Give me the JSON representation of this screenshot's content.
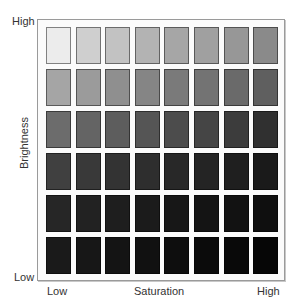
{
  "axes": {
    "y_title": "Brightness",
    "y_high": "High",
    "y_low": "Low",
    "x_title": "Saturation",
    "x_low": "Low",
    "x_high": "High"
  },
  "grid": {
    "rows": 6,
    "cols": 8,
    "colors": [
      [
        "#ececec",
        "#cfcfcf",
        "#c2c2c2",
        "#b3b3b3",
        "#a6a6a6",
        "#a0a0a0",
        "#979797",
        "#8a8a8a"
      ],
      [
        "#a5a5a5",
        "#9b9b9b",
        "#8f8f8f",
        "#858585",
        "#7a7a7a",
        "#737373",
        "#6a6a6a",
        "#5f5f5f"
      ],
      [
        "#6c6c6c",
        "#646464",
        "#5d5d5d",
        "#555555",
        "#4c4c4c",
        "#454545",
        "#3c3c3c",
        "#303030"
      ],
      [
        "#404040",
        "#393939",
        "#333333",
        "#2e2e2e",
        "#282828",
        "#242424",
        "#1f1f1f",
        "#1a1a1a"
      ],
      [
        "#262626",
        "#222222",
        "#1e1e1e",
        "#1b1b1b",
        "#171717",
        "#141414",
        "#121212",
        "#0f0f0f"
      ],
      [
        "#1a1a1a",
        "#171717",
        "#141414",
        "#111111",
        "#0e0e0e",
        "#0b0b0b",
        "#090909",
        "#060606"
      ]
    ]
  }
}
